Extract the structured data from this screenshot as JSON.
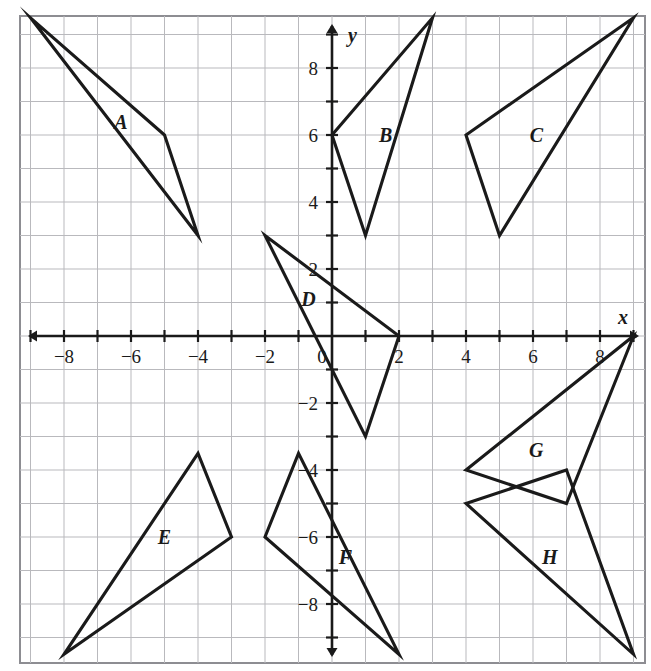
{
  "figure": {
    "kind": "coordinate-plane-with-triangles",
    "background_color": "#ffffff",
    "grid_color": "#b9b9bd",
    "border_color": "#8d8d92",
    "axis_color": "#1a1a1a",
    "shape_color": "#1a1a1a",
    "x_axis_label": "x",
    "y_axis_label": "y",
    "origin_label": "0"
  },
  "chart_data": {
    "type": "scatter",
    "title": "",
    "xlabel": "x",
    "ylabel": "y",
    "grid": true,
    "legend": "none",
    "xlim": [
      -9.3,
      9.5
    ],
    "ylim": [
      -9.8,
      9.9
    ],
    "x_ticks": [
      -8,
      -6,
      -4,
      -2,
      2,
      4,
      6,
      8
    ],
    "y_ticks": [
      8,
      6,
      4,
      2,
      -2,
      -4,
      -6,
      -8
    ],
    "x_tick_labels": [
      "−8",
      "−6",
      "−4",
      "−2",
      "2",
      "4",
      "6",
      "8"
    ],
    "y_tick_labels": [
      "8",
      "6",
      "4",
      "2",
      "−2",
      "−4",
      "−6",
      "−8"
    ],
    "minor_tick_step": 1,
    "shapes": [
      {
        "name": "A",
        "label": "A",
        "label_x": -6.3,
        "label_y": 6.4,
        "points": [
          [
            -9,
            9.5
          ],
          [
            -5,
            6
          ],
          [
            -4,
            3
          ]
        ]
      },
      {
        "name": "B",
        "label": "B",
        "label_x": 1.6,
        "label_y": 6.0,
        "points": [
          [
            0,
            6
          ],
          [
            3,
            9.5
          ],
          [
            1,
            3
          ]
        ]
      },
      {
        "name": "C",
        "label": "C",
        "label_x": 6.1,
        "label_y": 6.0,
        "points": [
          [
            4,
            6
          ],
          [
            9,
            9.5
          ],
          [
            5,
            3
          ]
        ]
      },
      {
        "name": "D",
        "label": "D",
        "label_x": -0.7,
        "label_y": 1.1,
        "points": [
          [
            -2,
            3
          ],
          [
            2,
            0
          ],
          [
            1,
            -3
          ]
        ]
      },
      {
        "name": "E",
        "label": "E",
        "label_x": -5.0,
        "label_y": -6.0,
        "points": [
          [
            -4,
            -3.5
          ],
          [
            -3,
            -6
          ],
          [
            -8,
            -9.5
          ]
        ]
      },
      {
        "name": "F",
        "label": "F",
        "label_x": 0.4,
        "label_y": -6.6,
        "points": [
          [
            -1,
            -3.5
          ],
          [
            -2,
            -6
          ],
          [
            2,
            -9.5
          ]
        ]
      },
      {
        "name": "G",
        "label": "G",
        "label_x": 6.1,
        "label_y": -3.4,
        "points": [
          [
            4,
            -4
          ],
          [
            9,
            0
          ],
          [
            7,
            -5
          ]
        ]
      },
      {
        "name": "H",
        "label": "H",
        "label_x": 6.5,
        "label_y": -6.6,
        "points": [
          [
            4,
            -5
          ],
          [
            7,
            -4
          ],
          [
            9,
            -9.5
          ]
        ]
      }
    ]
  }
}
